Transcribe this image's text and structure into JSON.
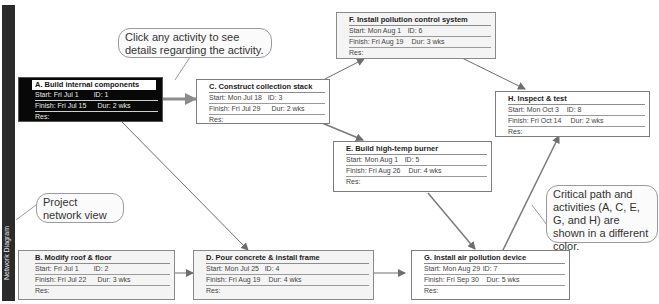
{
  "sidebar": {
    "label": "Network Diagram"
  },
  "callouts": {
    "click_hint": "Click any activity to see details regarding the activity.",
    "network_view": "Project network view",
    "critical_path": "Critical path and activities (A, C, E, G, and H) are shown in a different color."
  },
  "labels": {
    "start": "Start:",
    "finish": "Finish:",
    "id": "ID:",
    "dur": "Dur:",
    "res": "Res:"
  },
  "activities": {
    "A": {
      "title": "A. Build internal components",
      "start": "Fri Jul 1",
      "id": "1",
      "finish": "Fri Jul 15",
      "dur": "2 wks",
      "res": "",
      "critical": true
    },
    "B": {
      "title": "B. Modify roof & floor",
      "start": "Fri Jul 1",
      "id": "2",
      "finish": "Fri Jul 22",
      "dur": "3 wks",
      "res": "",
      "critical": false
    },
    "C": {
      "title": "C. Construct collection stack",
      "start": "Mon Jul 18",
      "id": "3",
      "finish": "Fri Jul 29",
      "dur": "2 wks",
      "res": "",
      "critical": true
    },
    "D": {
      "title": "D. Pour concrete & install frame",
      "start": "Mon Jul 25",
      "id": "4",
      "finish": "Fri Aug 19",
      "dur": "4 wks",
      "res": "",
      "critical": false
    },
    "E": {
      "title": "E. Build high-temp burner",
      "start": "Mon Aug 1",
      "id": "5",
      "finish": "Fri Aug 26",
      "dur": "4 wks",
      "res": "",
      "critical": true
    },
    "F": {
      "title": "F. Install pollution control system",
      "start": "Mon Aug 1",
      "id": "6",
      "finish": "Fri Aug 19",
      "dur": "3 wks",
      "res": "",
      "critical": false
    },
    "G": {
      "title": "G. Install air pollution device",
      "start": "Mon Aug 29",
      "id": "7",
      "finish": "Fri Sep 30",
      "dur": "5 wks",
      "res": "",
      "critical": true
    },
    "H": {
      "title": "H. Inspect & test",
      "start": "Mon Oct 3",
      "id": "8",
      "finish": "Fri Oct 14",
      "dur": "2 wks",
      "res": "",
      "critical": true
    }
  },
  "links": [
    {
      "from": "A",
      "to": "C",
      "critical": true
    },
    {
      "from": "A",
      "to": "D",
      "critical": false
    },
    {
      "from": "B",
      "to": "D",
      "critical": false
    },
    {
      "from": "C",
      "to": "F",
      "critical": false
    },
    {
      "from": "C",
      "to": "E",
      "critical": true
    },
    {
      "from": "D",
      "to": "G",
      "critical": false
    },
    {
      "from": "E",
      "to": "G",
      "critical": true
    },
    {
      "from": "F",
      "to": "H",
      "critical": false
    },
    {
      "from": "G",
      "to": "H",
      "critical": true
    }
  ],
  "colors": {
    "critical_node_bg": "#080808",
    "node_border": "#8a8a8a",
    "sidebar": "#2b2b2b",
    "link": "#777777",
    "critical_link": "#8a8a8a"
  }
}
